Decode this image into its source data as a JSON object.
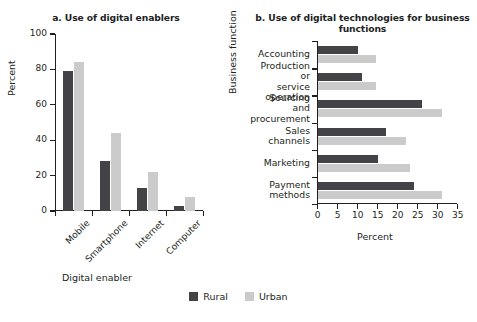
{
  "legend": {
    "items": [
      {
        "label": "Rural",
        "color": "#434247"
      },
      {
        "label": "Urban",
        "color": "#cbcbcb"
      }
    ]
  },
  "chart_data": [
    {
      "type": "bar",
      "panel": "a",
      "title": "a. Use of digital enablers",
      "xlabel": "Digital enabler",
      "ylabel": "Percent",
      "categories": [
        "Mobile",
        "Smartphone",
        "Internet",
        "Computer"
      ],
      "series": [
        {
          "name": "Rural",
          "color": "#434247",
          "values": [
            79,
            28,
            13,
            3
          ]
        },
        {
          "name": "Urban",
          "color": "#cbcbcb",
          "values": [
            84,
            44,
            22,
            8
          ]
        }
      ],
      "ylim": [
        0,
        100
      ],
      "yticks": [
        0,
        20,
        40,
        60,
        80,
        100
      ],
      "grid": false,
      "orientation": "vertical",
      "legend_position": "bottom"
    },
    {
      "type": "bar",
      "panel": "b",
      "title": "b. Use of digital technologies for business functions",
      "xlabel": "Percent",
      "ylabel": "Business function",
      "categories": [
        "Accounting",
        "Production or\nservice operation",
        "Sourcing and\nprocurement",
        "Sales channels",
        "Marketing",
        "Payment\nmethods"
      ],
      "series": [
        {
          "name": "Rural",
          "color": "#434247",
          "values": [
            10,
            11,
            26,
            17,
            15,
            24
          ]
        },
        {
          "name": "Urban",
          "color": "#cbcbcb",
          "values": [
            14.5,
            14.5,
            31,
            22,
            23,
            31
          ]
        }
      ],
      "xlim": [
        0,
        35
      ],
      "xticks": [
        0,
        5,
        10,
        15,
        20,
        25,
        30,
        35
      ],
      "grid": false,
      "orientation": "horizontal",
      "legend_position": "bottom"
    }
  ]
}
